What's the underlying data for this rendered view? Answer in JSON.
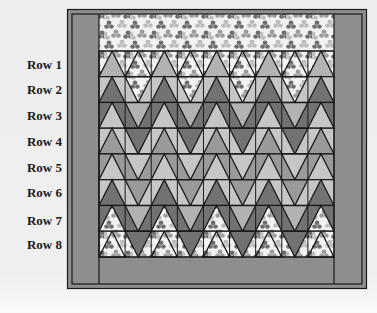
{
  "diagram": {
    "type": "quilt-layout",
    "row_labels": [
      "Row 1",
      "Row 2",
      "Row 3",
      "Row 4",
      "Row 5",
      "Row 6",
      "Row 7",
      "Row 8"
    ],
    "columns": 9,
    "colors": {
      "page_background": "#efefef",
      "border": "#8e8e8e",
      "outline": "#1a1a1a",
      "print_base": "#f2f2f2",
      "print_leaf_light": "#bcbcbc",
      "print_leaf_mid": "#9c9c9c",
      "print_leaf_dark": "#6e6e6e",
      "light": "#c6c6c6",
      "light_mid": "#b2b2b2",
      "medium": "#9a9a9a",
      "dark": "#727272"
    },
    "sections": {
      "top_band": "print",
      "side_borders": "border",
      "bottom_band": "border"
    },
    "rows": [
      {
        "label": "Row 1",
        "background": "print",
        "even": {
          "dir": "up",
          "fill": "light_mid"
        },
        "odd": {
          "dir": "up",
          "fill": "print"
        }
      },
      {
        "label": "Row 2",
        "background": "light",
        "even": {
          "dir": "up",
          "fill": "dark"
        },
        "odd": {
          "dir": "down",
          "fill": "print"
        }
      },
      {
        "label": "Row 3",
        "background": "dark",
        "even": {
          "dir": "up",
          "fill": "light"
        },
        "odd": {
          "dir": "down",
          "fill": "light_mid"
        }
      },
      {
        "label": "Row 4",
        "background": "light",
        "even": {
          "dir": "up",
          "fill": "medium"
        },
        "odd": {
          "dir": "down",
          "fill": "dark"
        }
      },
      {
        "label": "Row 5",
        "background": "medium",
        "even": {
          "dir": "up",
          "fill": "light"
        },
        "odd": {
          "dir": "down",
          "fill": "light"
        }
      },
      {
        "label": "Row 6",
        "background": "light",
        "even": {
          "dir": "up",
          "fill": "dark"
        },
        "odd": {
          "dir": "down",
          "fill": "medium"
        }
      },
      {
        "label": "Row 7",
        "background": "dark",
        "even": {
          "dir": "up",
          "fill": "print"
        },
        "odd": {
          "dir": "down",
          "fill": "light_mid"
        }
      },
      {
        "label": "Row 8",
        "background": "print",
        "even": {
          "dir": "up",
          "fill": "print"
        },
        "odd": {
          "dir": "down",
          "fill": "dark"
        }
      }
    ]
  }
}
